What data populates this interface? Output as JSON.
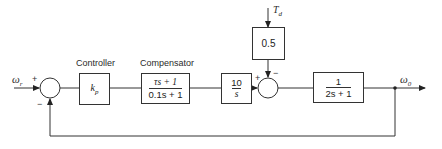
{
  "diagram": {
    "type": "block-diagram",
    "title": "",
    "input": {
      "label": "ω",
      "subscript": "r"
    },
    "output": {
      "label": "ω",
      "subscript": "0"
    },
    "disturbance": {
      "label": "T",
      "subscript": "d"
    },
    "summing_junctions": [
      {
        "id": "sum1",
        "signs": {
          "left": "+",
          "bottom": "−"
        }
      },
      {
        "id": "sum2",
        "signs": {
          "left": "+",
          "top": "−"
        }
      }
    ],
    "blocks": [
      {
        "id": "controller",
        "caption": "Controller",
        "expr": "k",
        "expr_sub": "p"
      },
      {
        "id": "compensator",
        "caption": "Compensator",
        "numerator": "τs + 1",
        "denominator": "0.1s + 1"
      },
      {
        "id": "integrator",
        "caption": "",
        "numerator": "10",
        "denominator": "s"
      },
      {
        "id": "disturbance-gain",
        "caption": "",
        "expr": "0.5"
      },
      {
        "id": "plant",
        "caption": "",
        "numerator": "1",
        "denominator": "2s + 1"
      }
    ],
    "feedback": "unity negative feedback from ω0 to first summing junction"
  }
}
